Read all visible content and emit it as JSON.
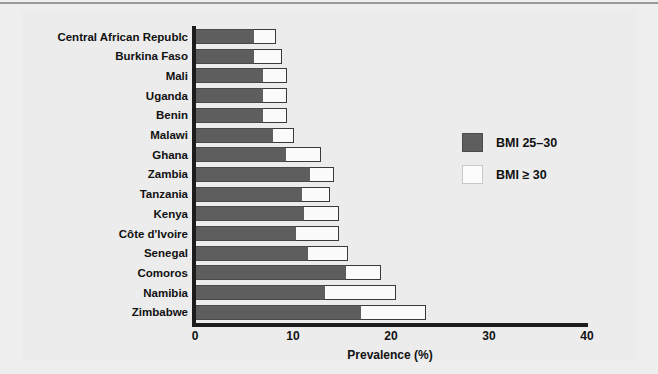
{
  "chart_data": {
    "type": "bar",
    "orientation": "horizontal",
    "stacked": true,
    "title": "",
    "xlabel": "Prevalence (%)",
    "ylabel": "",
    "xlim": [
      0,
      40
    ],
    "xticks": [
      "0",
      "10",
      "20",
      "30",
      "40"
    ],
    "xtick_values": [
      0,
      10,
      20,
      30,
      40
    ],
    "grid": false,
    "legend_position": "upper right (inside plot)",
    "categories": [
      "Central African Republc",
      "Burkina Faso",
      "Mali",
      "Uganda",
      "Benin",
      "Malawi",
      "Ghana",
      "Zambia",
      "Tanzania",
      "Kenya",
      "Côte d'Ivoire",
      "Senegal",
      "Comoros",
      "Namibia",
      "Zimbabwe"
    ],
    "series": [
      {
        "name": "BMI 25–30",
        "color": "#5e5e5e",
        "values": [
          5.9,
          5.9,
          6.8,
          6.8,
          6.8,
          7.9,
          9.2,
          11.6,
          10.8,
          11.0,
          10.2,
          11.4,
          15.3,
          13.2,
          16.8
        ]
      },
      {
        "name": "BMI ≥ 30",
        "color": "#fbfbfb",
        "values": [
          2.3,
          2.9,
          2.5,
          2.5,
          2.5,
          2.1,
          3.6,
          2.5,
          2.9,
          3.6,
          4.4,
          4.1,
          3.6,
          7.2,
          6.7
        ]
      }
    ],
    "totals": [
      8.2,
      8.8,
      9.3,
      9.3,
      9.3,
      10.0,
      12.8,
      14.1,
      13.7,
      14.6,
      14.6,
      15.5,
      18.9,
      20.4,
      23.5
    ]
  },
  "legend": {
    "items": [
      {
        "label": "BMI 25–30",
        "swatch": "dark"
      },
      {
        "label": "BMI ≥ 30",
        "swatch": "light"
      }
    ]
  },
  "axis": {
    "x_title": "Prevalence (%)",
    "ticks": [
      "0",
      "10",
      "20",
      "30",
      "40"
    ]
  }
}
